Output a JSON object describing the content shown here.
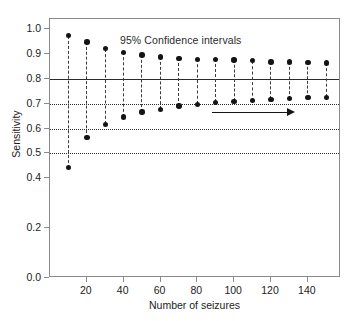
{
  "chart_data": {
    "type": "scatter",
    "title": "",
    "annotation": "95% Confidence intervals",
    "xlabel": "Number of seizures",
    "ylabel": "Sensitivity",
    "xlim": [
      0,
      158
    ],
    "ylim": [
      0.0,
      1.04
    ],
    "grid": false,
    "legend": null,
    "x": [
      10,
      20,
      30,
      40,
      50,
      60,
      70,
      80,
      90,
      100,
      110,
      120,
      130,
      140,
      150
    ],
    "series": [
      {
        "name": "Upper 95% confidence limit",
        "values": [
          0.973,
          0.948,
          0.921,
          0.906,
          0.895,
          0.888,
          0.882,
          0.878,
          0.878,
          0.875,
          0.873,
          0.867,
          0.867,
          0.866,
          0.864
        ]
      },
      {
        "name": "Lower 95% confidence limit",
        "values": [
          0.443,
          0.563,
          0.617,
          0.646,
          0.666,
          0.677,
          0.69,
          0.697,
          0.705,
          0.709,
          0.712,
          0.717,
          0.72,
          0.724,
          0.726
        ]
      }
    ],
    "reference_lines": [
      {
        "value": 0.8,
        "style": "solid"
      },
      {
        "value": 0.7,
        "style": "dotted"
      },
      {
        "value": 0.6,
        "style": "dotted"
      },
      {
        "value": 0.5,
        "style": "dotted"
      }
    ],
    "arrow_annotation": {
      "x_start": 88,
      "x_end": 133,
      "y": 0.665,
      "direction": "right"
    },
    "yticks": [
      {
        "value": 1.0,
        "label": "1.0"
      },
      {
        "value": 0.9,
        "label": "0.9"
      },
      {
        "value": 0.8,
        "label": "0.8"
      },
      {
        "value": 0.7,
        "label": "0.7"
      },
      {
        "value": 0.6,
        "label": "0.6"
      },
      {
        "value": 0.5,
        "label": "0.5"
      },
      {
        "value": 0.4,
        "label": "0.4"
      },
      {
        "value": 0.2,
        "label": "0.2"
      },
      {
        "value": 0.0,
        "label": "0.0"
      }
    ],
    "xticks": [
      {
        "value": 20,
        "label": "20"
      },
      {
        "value": 40,
        "label": "40"
      },
      {
        "value": 60,
        "label": "60"
      },
      {
        "value": 80,
        "label": "80"
      },
      {
        "value": 100,
        "label": "100"
      },
      {
        "value": 120,
        "label": "120"
      },
      {
        "value": 140,
        "label": "140"
      }
    ],
    "colors": {
      "marker": "#141414",
      "stem": "#3a3a3a",
      "reference_solid": "#2b2b2b",
      "reference_dotted": "#2b2b2b",
      "axis": "#8a8a8a",
      "text": "#1c1c1c",
      "background": "#ffffff"
    }
  }
}
